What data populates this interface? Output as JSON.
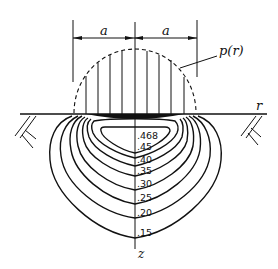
{
  "diagram": {
    "title": "",
    "dimension": {
      "left_label": "a",
      "right_label": "a"
    },
    "pressure_label": "p(r)",
    "axis_r_label": "r",
    "axis_z_label": "z",
    "contours": [
      {
        "label": ".468",
        "value": 0.468
      },
      {
        "label": ".45",
        "value": 0.45
      },
      {
        "label": ".40",
        "value": 0.4
      },
      {
        "label": ".35",
        "value": 0.35
      },
      {
        "label": ".30",
        "value": 0.3
      },
      {
        "label": ".25",
        "value": 0.25
      },
      {
        "label": ".20",
        "value": 0.2
      },
      {
        "label": ".15",
        "value": 0.15
      }
    ],
    "colors": {
      "ink": "#111111",
      "background": "#ffffff"
    }
  }
}
